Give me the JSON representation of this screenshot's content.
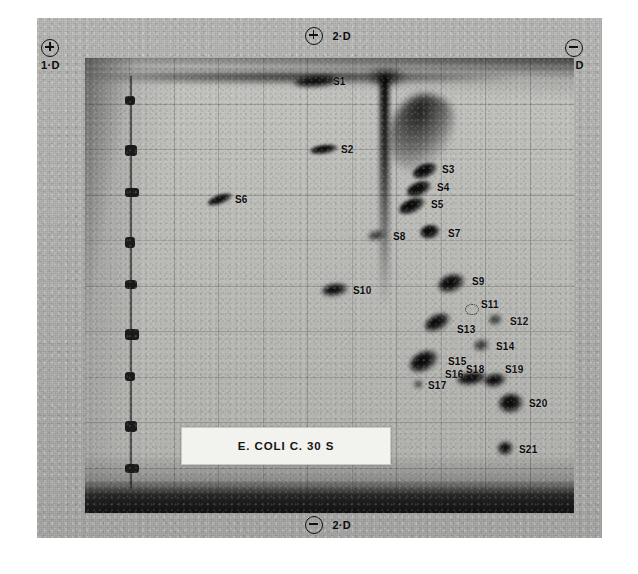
{
  "figure": {
    "caption_label": "E. COLI C. 30 S",
    "medium": "two-dimensional polyacrylamide gel autoradiograph",
    "colors": {
      "paper": "#b4b4b2",
      "gel": "#c2c2bf",
      "spot": "#0a0a0a",
      "label_text": "#0a0a0a",
      "caption_bg": "#f2f2ee"
    }
  },
  "axes": {
    "top_left": {
      "polarity": "+",
      "dimension": "1·D",
      "icon": "circled-plus-icon"
    },
    "top_center": {
      "polarity": "+",
      "dimension": "2·D",
      "icon": "circled-plus-icon"
    },
    "top_right": {
      "polarity": "−",
      "dimension": "1·D",
      "icon": "circled-minus-icon"
    },
    "bottom_center": {
      "polarity": "−",
      "dimension": "2·D",
      "icon": "circled-minus-icon"
    }
  },
  "chart_data": {
    "type": "scatter",
    "title": "E. COLI C. 30 S",
    "xlabel": "2-D (second dimension)",
    "ylabel": "1-D (first dimension)",
    "xlim": [
      0,
      489
    ],
    "ylim": [
      0,
      455
    ],
    "grid": true,
    "legend": "none",
    "annotations": [
      "+ 1-D at top left",
      "+ 2-D at top center",
      "- 1-D at top right",
      "- 2-D at bottom center"
    ],
    "points": [
      {
        "label": "S1",
        "x": 232,
        "y": 23,
        "w": 46,
        "h": 11,
        "rot": -4,
        "intensity": "heavy",
        "lx": 248,
        "ly": 18,
        "anchor": "right"
      },
      {
        "label": "S2",
        "x": 239,
        "y": 91,
        "w": 28,
        "h": 9,
        "rot": -8,
        "intensity": "strong",
        "lx": 256,
        "ly": 86,
        "anchor": "right"
      },
      {
        "label": "S3",
        "x": 340,
        "y": 113,
        "w": 26,
        "h": 14,
        "rot": -22,
        "intensity": "strong",
        "lx": 357,
        "ly": 106,
        "anchor": "right"
      },
      {
        "label": "S4",
        "x": 334,
        "y": 131,
        "w": 26,
        "h": 14,
        "rot": -22,
        "intensity": "strong",
        "lx": 352,
        "ly": 124,
        "anchor": "right"
      },
      {
        "label": "S5",
        "x": 327,
        "y": 148,
        "w": 28,
        "h": 14,
        "rot": -24,
        "intensity": "strong",
        "lx": 346,
        "ly": 141,
        "anchor": "right"
      },
      {
        "label": "S6",
        "x": 135,
        "y": 141,
        "w": 26,
        "h": 9,
        "rot": -20,
        "intensity": "strong",
        "lx": 150,
        "ly": 136,
        "anchor": "right"
      },
      {
        "label": "S7",
        "x": 345,
        "y": 174,
        "w": 20,
        "h": 14,
        "rot": -10,
        "intensity": "strong",
        "lx": 363,
        "ly": 170,
        "anchor": "right"
      },
      {
        "label": "S8",
        "x": 292,
        "y": 177,
        "w": 19,
        "h": 9,
        "rot": -10,
        "intensity": "medium",
        "lx": 308,
        "ly": 173,
        "anchor": "right"
      },
      {
        "label": "S9",
        "x": 366,
        "y": 225,
        "w": 27,
        "h": 17,
        "rot": -18,
        "intensity": "heavy",
        "lx": 387,
        "ly": 218,
        "anchor": "right"
      },
      {
        "label": "S10",
        "x": 250,
        "y": 232,
        "w": 26,
        "h": 12,
        "rot": -8,
        "intensity": "heavy",
        "lx": 268,
        "ly": 227,
        "anchor": "right"
      },
      {
        "label": "S11",
        "x": 386,
        "y": 250,
        "w": 12,
        "h": 9,
        "rot": 0,
        "intensity": "ghost",
        "lx": 396,
        "ly": 241,
        "anchor": "right"
      },
      {
        "label": "S12",
        "x": 410,
        "y": 262,
        "w": 13,
        "h": 10,
        "rot": -12,
        "intensity": "medium",
        "lx": 425,
        "ly": 258,
        "anchor": "right"
      },
      {
        "label": "S13",
        "x": 352,
        "y": 264,
        "w": 27,
        "h": 15,
        "rot": -26,
        "intensity": "heavy",
        "lx": 372,
        "ly": 266,
        "anchor": "right"
      },
      {
        "label": "S14",
        "x": 396,
        "y": 287,
        "w": 15,
        "h": 11,
        "rot": -10,
        "intensity": "medium",
        "lx": 411,
        "ly": 283,
        "anchor": "right"
      },
      {
        "label": "S15",
        "x": 339,
        "y": 303,
        "w": 30,
        "h": 19,
        "rot": -28,
        "intensity": "heavy",
        "lx": 363,
        "ly": 298,
        "anchor": "right"
      },
      {
        "label": "S16",
        "x": 339,
        "y": 303,
        "w": 0,
        "h": 0,
        "rot": 0,
        "intensity": "none",
        "lx": 360,
        "ly": 311,
        "anchor": "right"
      },
      {
        "label": "S17",
        "x": 333,
        "y": 326,
        "w": 9,
        "h": 7,
        "rot": 0,
        "intensity": "faint",
        "lx": 343,
        "ly": 322,
        "anchor": "right"
      },
      {
        "label": "S18",
        "x": 387,
        "y": 320,
        "w": 30,
        "h": 13,
        "rot": -8,
        "intensity": "heavy",
        "lx": 381,
        "ly": 306,
        "anchor": "right"
      },
      {
        "label": "S19",
        "x": 410,
        "y": 322,
        "w": 22,
        "h": 13,
        "rot": -10,
        "intensity": "heavy",
        "lx": 420,
        "ly": 306,
        "anchor": "right"
      },
      {
        "label": "S20",
        "x": 426,
        "y": 345,
        "w": 24,
        "h": 19,
        "rot": -6,
        "intensity": "heavy",
        "lx": 444,
        "ly": 340,
        "anchor": "right"
      },
      {
        "label": "S21",
        "x": 420,
        "y": 390,
        "w": 15,
        "h": 13,
        "rot": -8,
        "intensity": "heavy",
        "lx": 434,
        "ly": 386,
        "anchor": "right"
      }
    ],
    "reference_lane": {
      "description": "vertical marker lane at left of gel",
      "marks": 9
    },
    "streaks": [
      {
        "name": "origin-streak-horizontal",
        "x": 0,
        "y": 14,
        "w": 430,
        "h": 10
      },
      {
        "name": "origin-spot-2d",
        "x": 282,
        "y": 10,
        "w": 38,
        "h": 18
      },
      {
        "name": "origin-streak-vertical",
        "x": 295,
        "y": 18,
        "w": 9,
        "h": 230
      },
      {
        "name": "diagonal-smear",
        "x": 305,
        "y": 35,
        "w": 60,
        "h": 80
      }
    ]
  }
}
